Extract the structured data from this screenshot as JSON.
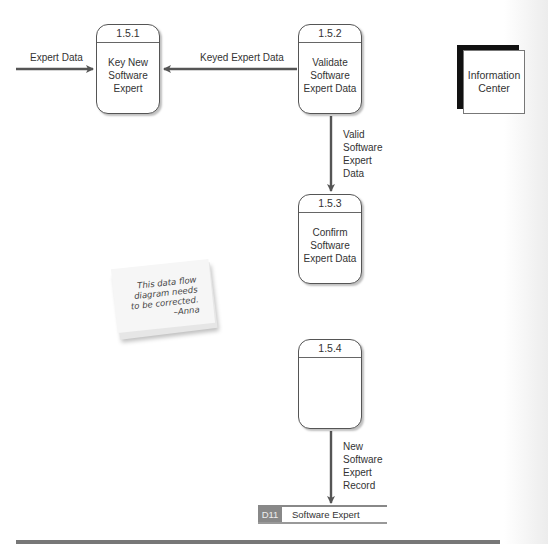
{
  "diagram": {
    "type": "data-flow-diagram",
    "processes": [
      {
        "id": "1.5.1",
        "label": "Key New Software Expert"
      },
      {
        "id": "1.5.2",
        "label": "Validate Software Expert Data"
      },
      {
        "id": "1.5.3",
        "label": "Confirm Software Expert Data"
      },
      {
        "id": "1.5.4",
        "label": ""
      }
    ],
    "external_entities": [
      {
        "label": "Information Center"
      }
    ],
    "data_stores": [
      {
        "id": "D11",
        "label": "Software Expert"
      }
    ],
    "flows": [
      {
        "label": "Expert Data",
        "from": "(offscreen left)",
        "to": "1.5.1"
      },
      {
        "label": "Keyed Expert Data",
        "from": "1.5.2",
        "to": "1.5.1"
      },
      {
        "label": "Valid Software Expert Data",
        "from": "1.5.2",
        "to": "1.5.3"
      },
      {
        "label": "New Software Expert Record",
        "from": "1.5.4",
        "to": "D11"
      }
    ],
    "sticky_note": {
      "lines": [
        "This data flow",
        "diagram needs",
        "to be corrected.",
        "–Anna"
      ]
    },
    "colors": {
      "line": "#555555",
      "store_id_bg": "#888888",
      "entity_shadow": "#111111",
      "note_bg": "#f4f4f4"
    }
  }
}
